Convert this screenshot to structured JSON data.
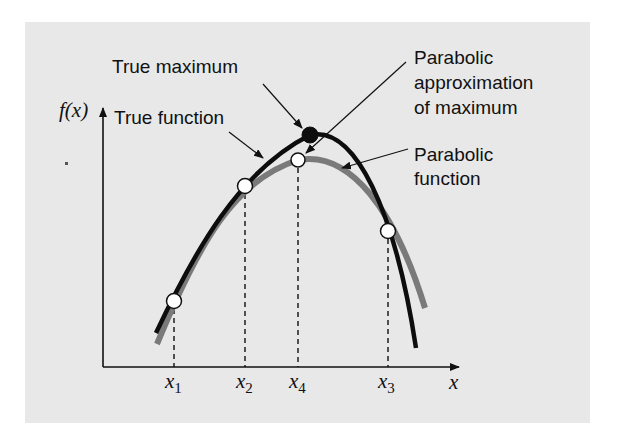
{
  "figure": {
    "background_color": "#ffffff",
    "panel_color": "#e8e8e8",
    "true_curve_color": "#0d0d0d",
    "parabola_color": "#7a7a7a"
  },
  "labels": {
    "true_maximum": "True maximum",
    "true_function": "True function",
    "parabolic_approx_line1": "Parabolic",
    "parabolic_approx_line2": "approximation",
    "parabolic_approx_line3": "of maximum",
    "parabolic_function_line1": "Parabolic",
    "parabolic_function_line2": "function"
  },
  "axes": {
    "y_label": "f(x)",
    "x_label": "x"
  },
  "ticks": [
    {
      "base": "x",
      "sub": "1"
    },
    {
      "base": "x",
      "sub": "2"
    },
    {
      "base": "x",
      "sub": "4"
    },
    {
      "base": "x",
      "sub": "3"
    }
  ],
  "points": {
    "x1": "open circle on both curves",
    "x2": "open circle on both curves",
    "x3": "open circle on both curves",
    "x4": "open circle at parabola maximum",
    "true_max": "filled circle at true function maximum"
  }
}
